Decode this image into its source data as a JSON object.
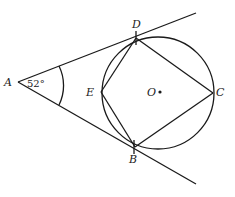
{
  "diagram": {
    "type": "geometry",
    "points": {
      "A": {
        "label": "A",
        "x": 18,
        "y": 82
      },
      "D": {
        "label": "D",
        "x": 136,
        "y": 38
      },
      "B": {
        "label": "B",
        "x": 135,
        "y": 147
      },
      "C": {
        "label": "C",
        "x": 213,
        "y": 93
      },
      "E": {
        "label": "E",
        "x": 101,
        "y": 92
      },
      "O": {
        "label": "O",
        "x": 158,
        "y": 93
      }
    },
    "circle": {
      "cx": 158,
      "cy": 93,
      "r": 56
    },
    "angle_A": "52°",
    "line_color": "#1a1a1a"
  }
}
